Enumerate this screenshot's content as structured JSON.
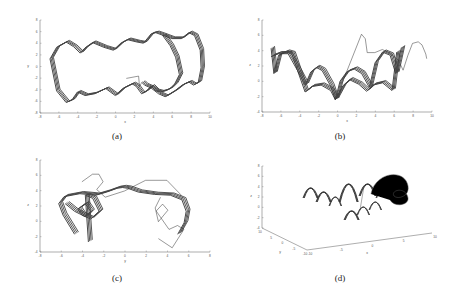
{
  "figure": {
    "captions": [
      "(a)",
      "(b)",
      "(c)",
      "(d)"
    ]
  },
  "chart_data": [
    {
      "id": "a",
      "type": "line",
      "title": "",
      "xlabel": "x",
      "ylabel": "y",
      "xlim": [
        -8,
        10
      ],
      "ylim": [
        -8,
        8
      ],
      "xticks": [
        "-8",
        "-6",
        "-4",
        "-2",
        "0",
        "2",
        "4",
        "6",
        "8",
        "10"
      ],
      "yticks": [
        "8",
        "6",
        "4",
        "2",
        "0",
        "-2",
        "-4",
        "-6",
        "-8"
      ],
      "grid": false,
      "description": "Phase portrait x-y: closed wavy loop from x≈-6.8 to 7, with extra excursion loop to x≈9.3",
      "series": [
        {
          "name": "main-loop",
          "x": [
            -6.7,
            -6,
            -5,
            -4.2,
            -3.5,
            -3,
            -2.2,
            -1,
            0,
            0.8,
            1.5,
            2.5,
            3.2,
            4,
            4.5,
            5.2,
            6,
            6.6,
            7,
            6.5,
            6,
            5.5,
            5,
            4.5,
            4,
            3.5,
            3,
            2.4,
            2,
            1,
            0.2,
            -0.8,
            -2,
            -3,
            -3.8,
            -4.4,
            -5,
            -6,
            -6.7
          ],
          "y": [
            1.5,
            3.5,
            4.4,
            3.6,
            2.5,
            3.4,
            4.3,
            3.5,
            3,
            4.2,
            4.8,
            4.4,
            4.2,
            5.8,
            6,
            5.6,
            3.8,
            1.8,
            -1.2,
            -2.8,
            -3.6,
            -4,
            -4.2,
            -4,
            -3.2,
            -4,
            -4.5,
            -3.2,
            -2.8,
            -3.6,
            -4.8,
            -3.6,
            -4.5,
            -4.8,
            -4.2,
            -5.6,
            -6,
            -4,
            1.5
          ]
        },
        {
          "name": "excursion-loop",
          "x": [
            5.2,
            6.2,
            7.2,
            8,
            8.6,
            9.2,
            9.3,
            9,
            8.5,
            8,
            7.3,
            6.5,
            5.5,
            4.8,
            4,
            3.3,
            3
          ],
          "y": [
            5.6,
            5,
            5,
            6,
            5.5,
            3,
            0,
            -2.5,
            -3,
            -2.5,
            -3,
            -4,
            -5,
            -4.5,
            -3.5,
            -3,
            -2.5
          ]
        },
        {
          "name": "transient",
          "x": [
            1.2,
            2.5,
            2.6,
            2.8
          ],
          "y": [
            -2,
            -1.6,
            -3.4,
            -2.8
          ]
        }
      ]
    },
    {
      "id": "b",
      "type": "line",
      "title": "",
      "xlabel": "x",
      "ylabel": "z",
      "xlim": [
        -8,
        10
      ],
      "ylim": [
        -4,
        8
      ],
      "xticks": [
        "-8",
        "-6",
        "-4",
        "-2",
        "0",
        "2",
        "4",
        "6",
        "8",
        "10"
      ],
      "yticks": [
        "8",
        "6",
        "4",
        "2",
        "0",
        "-2",
        "-4"
      ],
      "grid": false,
      "description": "Projection x-z: series of arch (scallop) shapes; upper band of arches z≈1.8-4, lower band z≈-2 to 0",
      "series": [
        {
          "name": "upper-arches",
          "x": [
            -6.8,
            -6.5,
            -6,
            -5.2,
            -4.6,
            -4,
            -3.2,
            -2.6,
            -2,
            -1.4,
            -0.5,
            0,
            0.5,
            1.2,
            2,
            2.8,
            3.6,
            4.2,
            5,
            5.8,
            6.4,
            7
          ],
          "y": [
            4.5,
            1.2,
            3.6,
            4,
            3.8,
            1.6,
            -0.3,
            1.4,
            2,
            1.6,
            -0.4,
            -2.2,
            0.2,
            1.4,
            1.8,
            1.2,
            -0.6,
            2.6,
            4,
            3.6,
            1.2,
            4.6
          ]
        },
        {
          "name": "lower-arches",
          "x": [
            -6.8,
            -6,
            -5,
            -4,
            -3.2,
            -2.5,
            -1.5,
            -0.5,
            0,
            0.8,
            1.5,
            2.5,
            3.3,
            4,
            5,
            6,
            6.5
          ],
          "y": [
            3.4,
            3.8,
            3.8,
            1.6,
            -1.2,
            -0.5,
            -0.3,
            -1,
            -2.2,
            -0.4,
            0.4,
            -0.2,
            -1.1,
            -0.3,
            0,
            -1,
            4
          ]
        },
        {
          "name": "excursion",
          "x": [
            0.6,
            2.6,
            3,
            3.2,
            4,
            4.8,
            5.5,
            6.5,
            7,
            7.5,
            8,
            8.6,
            9,
            9.4,
            9.5
          ],
          "y": [
            0,
            6.2,
            5.6,
            3.8,
            3.8,
            4.2,
            3.8,
            2.8,
            1.5,
            3.4,
            5,
            5.2,
            4.8,
            3.6,
            3
          ],
          "note": "includes dip to z≈-3.4 near x≈3.2"
        }
      ]
    },
    {
      "id": "c",
      "type": "line",
      "title": "",
      "xlabel": "y",
      "ylabel": "z",
      "xlim": [
        -8,
        8
      ],
      "ylim": [
        -4,
        8
      ],
      "xticks": [
        "-8",
        "-6",
        "-4",
        "-2",
        "0",
        "2",
        "4",
        "6",
        "8"
      ],
      "yticks": [
        "8",
        "6",
        "4",
        "2",
        "0",
        "-2",
        "-4"
      ],
      "grid": false,
      "description": "Projection y-z: symmetric arch from y≈-6 to 6 peaking z≈4.5 at y=0, with inner loops near y≈±3.5",
      "series": [
        {
          "name": "main-arch",
          "x": [
            -4.5,
            -5.6,
            -6,
            -5.5,
            -4,
            -2.5,
            -1.5,
            -0.5,
            0,
            0.5,
            1.5,
            3,
            4.5,
            5.6,
            6,
            5.8,
            5.2
          ],
          "y": [
            -1.5,
            1,
            2.5,
            3.4,
            3.8,
            3.6,
            4,
            4.5,
            4.6,
            4.5,
            4,
            3.7,
            3.6,
            3,
            1.5,
            0,
            -1.5
          ]
        },
        {
          "name": "inner-loops-left",
          "x": [
            -5.4,
            -4.5,
            -3.5,
            -3,
            -3.5,
            -4.2,
            -3.8,
            -3,
            -2.2,
            -2.8,
            -3.5,
            -3.2
          ],
          "y": [
            2.5,
            1.5,
            0.8,
            1.5,
            2.5,
            1.8,
            1,
            0.5,
            1.5,
            3.2,
            3.6,
            -2.5
          ]
        },
        {
          "name": "inner-loops-right",
          "x": [
            3.4,
            2.9,
            3.2,
            4.1,
            3.6,
            3,
            4.2,
            5,
            5.6,
            4.5,
            3.2
          ],
          "y": [
            3.2,
            1.8,
            0,
            1.5,
            2.3,
            1.4,
            -1,
            -0.5,
            -1,
            -3.4,
            -2.2
          ]
        },
        {
          "name": "outer-excursion",
          "x": [
            -4,
            -3,
            -2.4,
            -2,
            -2.6,
            -1.8,
            0,
            2,
            4,
            5.4
          ],
          "y": [
            5.2,
            6.2,
            6.2,
            5.2,
            4.2,
            3.2,
            4,
            5.4,
            5.4,
            3.4
          ]
        }
      ]
    },
    {
      "id": "d",
      "type": "line",
      "title": "",
      "description": "3D trajectory (x,y,z): row of arches with excursion loop, isometric view",
      "xlabel": "x",
      "ylabel": "y",
      "zlabel": "z",
      "zticks": [
        "8",
        "6",
        "4",
        "2",
        "0",
        "-2",
        "-4"
      ],
      "yticks": [
        "10",
        "5",
        "0",
        "-5",
        "-10"
      ],
      "xticks": [
        "-10",
        "-5",
        "0",
        "5",
        "10"
      ],
      "grid": false
    }
  ]
}
